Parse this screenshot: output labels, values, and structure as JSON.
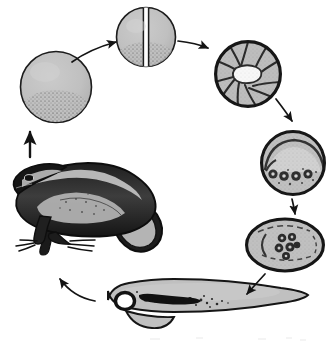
{
  "figure": {
    "cycle_direction": "clockwise",
    "has_text_labels": false,
    "background_color": "#ffffff",
    "ink_color": "#1a1a1a",
    "fill_gray": "#c0c0c0",
    "fill_gray_dark": "#a8a8a8",
    "highlight_white": "#ffffff",
    "stage_count": 7,
    "arrow_count": 7
  },
  "stages": [
    {
      "id": "fertilized-egg",
      "name": "fertilized-egg",
      "order": 1,
      "shape": "circle",
      "cx": 56,
      "cy": 87,
      "r": 36,
      "description": "single gray sphere with stippled lower hemisphere"
    },
    {
      "id": "two-cell",
      "name": "two-cell-stage",
      "order": 2,
      "shape": "circle-split",
      "cx": 146,
      "cy": 37,
      "r": 30,
      "description": "sphere divided by vertical cleavage furrow into two blastomeres"
    },
    {
      "id": "morula",
      "name": "morula-stage",
      "order": 3,
      "shape": "circle-segmented",
      "cx": 248,
      "cy": 74,
      "r": 34,
      "segments": 11,
      "description": "radially segmented blastomeres around white central blastocoel"
    },
    {
      "id": "gastrula",
      "name": "gastrula-stage",
      "order": 4,
      "shape": "circle-archenteron",
      "cx": 293,
      "cy": 163,
      "r": 33,
      "dark_cells": 4,
      "description": "arched archenteron with row of dark nucleated cells beneath"
    },
    {
      "id": "neurula",
      "name": "neurula-stage",
      "order": 5,
      "shape": "ellipse",
      "cx": 285,
      "cy": 245,
      "rx": 40,
      "ry": 27,
      "dark_cells": 6,
      "description": "oval embryo with dashed neural folds and cluster of dark cells"
    },
    {
      "id": "tadpole",
      "name": "tadpole-larva",
      "order": 6,
      "shape": "tadpole",
      "cx": 185,
      "cy": 310,
      "description": "elongated larva, round eye at left head, dark gut band, tapering tail right"
    },
    {
      "id": "adult-frog",
      "name": "adult-frog",
      "order": 7,
      "shape": "frog",
      "cx": 90,
      "cy": 215,
      "facing": "left",
      "description": "adult frog in sitting posture facing left with folded hind leg"
    }
  ],
  "arrows": [
    {
      "id": "arrow-egg-to-two-cell",
      "name": "arrow-egg-to-two-cell",
      "from": "fertilized-egg",
      "to": "two-cell",
      "style": "curved"
    },
    {
      "id": "arrow-two-cell-to-morula",
      "name": "arrow-two-cell-to-morula",
      "from": "two-cell",
      "to": "morula",
      "style": "straight"
    },
    {
      "id": "arrow-morula-to-gastrula",
      "name": "arrow-morula-to-gastrula",
      "from": "morula",
      "to": "gastrula",
      "style": "straight"
    },
    {
      "id": "arrow-gastrula-to-neurula",
      "name": "arrow-gastrula-to-neurula",
      "from": "gastrula",
      "to": "neurula",
      "style": "straight"
    },
    {
      "id": "arrow-neurula-to-tadpole",
      "name": "arrow-neurula-to-tadpole",
      "from": "neurula",
      "to": "tadpole",
      "style": "straight"
    },
    {
      "id": "arrow-tadpole-to-frog",
      "name": "arrow-tadpole-to-frog",
      "from": "tadpole",
      "to": "adult-frog",
      "style": "curved"
    },
    {
      "id": "arrow-frog-to-egg",
      "name": "arrow-frog-to-egg",
      "from": "adult-frog",
      "to": "fertilized-egg",
      "style": "straight-vertical"
    }
  ]
}
